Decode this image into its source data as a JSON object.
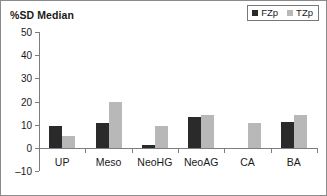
{
  "chart_data": {
    "type": "bar",
    "title": "%SD Median",
    "xlabel": "",
    "ylabel": "",
    "ylim": [
      -10,
      50
    ],
    "yticks": [
      50,
      40,
      30,
      20,
      10,
      0,
      -10
    ],
    "ytick_labels": [
      "50",
      "40",
      "30",
      "20",
      "10",
      "0",
      "–10"
    ],
    "grid": false,
    "legend_position": "top-right",
    "categories": [
      "UP",
      "Meso",
      "NeoHG",
      "NeoAG",
      "CA",
      "BA"
    ],
    "series": [
      {
        "name": "FZp",
        "color": "#2a2a2a",
        "values": [
          9.5,
          11.0,
          1.3,
          13.2,
          null,
          11.3
        ]
      },
      {
        "name": "TZp",
        "color": "#b8b8b8",
        "values": [
          5.2,
          19.8,
          9.5,
          14.3,
          11.0,
          14.3
        ]
      }
    ]
  },
  "legend": {
    "items": [
      {
        "label": "FZp",
        "swatch": "legend-swatch-dark"
      },
      {
        "label": "TZp",
        "swatch": "legend-swatch-light"
      }
    ]
  }
}
